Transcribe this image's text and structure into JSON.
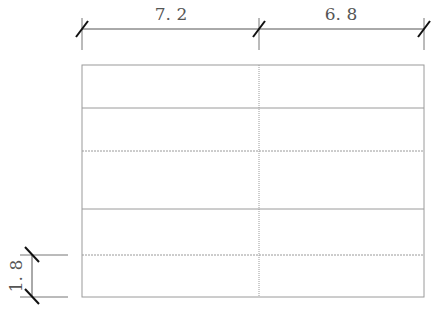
{
  "diagram": {
    "type": "grid-plan-with-dimensions",
    "colors": {
      "dimension_line": "#555555",
      "tick": "#111111",
      "grid_line": "#9a9a9a",
      "text": "#555555"
    },
    "top_dimensions": [
      {
        "label": "7. 2",
        "x1": 82,
        "x2": 259
      },
      {
        "label": "6. 8",
        "x1": 259,
        "x2": 424
      }
    ],
    "left_dimension": {
      "label": "1. 8",
      "y1": 255,
      "y2": 297
    },
    "grid": {
      "columns_x": [
        82,
        259,
        424
      ],
      "rows_y": [
        65,
        108,
        151,
        209,
        255,
        297
      ]
    }
  }
}
